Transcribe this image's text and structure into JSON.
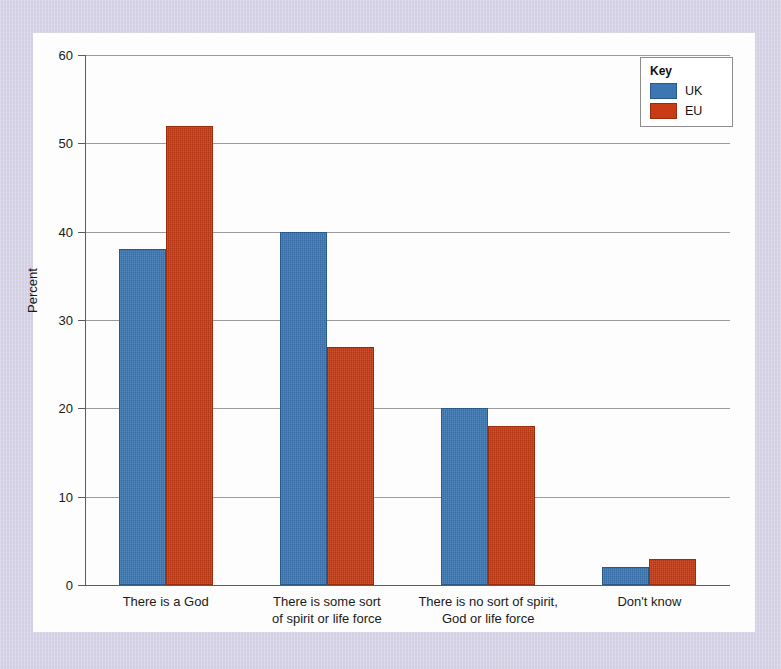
{
  "chart_data": {
    "type": "bar",
    "title": "",
    "xlabel": "",
    "ylabel": "Percent",
    "ylim": [
      0,
      60
    ],
    "yticks": [
      0,
      10,
      20,
      30,
      40,
      50,
      60
    ],
    "grid": true,
    "legend_position": "top-right",
    "categories": [
      "There is a God",
      "There is some sort\nof spirit or life force",
      "There is no sort of spirit,\nGod or life force",
      "Don't know"
    ],
    "category_lines": [
      [
        "There is a God"
      ],
      [
        "There is some sort",
        "of spirit or life force"
      ],
      [
        "There is no sort of spirit,",
        "God or life force"
      ],
      [
        "Don't know"
      ]
    ],
    "series": [
      {
        "name": "UK",
        "color": "#3b77b3",
        "values": [
          38,
          40,
          20,
          2
        ]
      },
      {
        "name": "EU",
        "color": "#c83b14",
        "values": [
          52,
          27,
          18,
          3
        ]
      }
    ]
  },
  "legend": {
    "title": "Key",
    "entries": [
      {
        "label": "UK",
        "color": "#3b77b3"
      },
      {
        "label": "EU",
        "color": "#c83b14"
      }
    ]
  },
  "colors": {
    "background": "#d3cfe4",
    "card": "#fdfdfd",
    "axis": "#5d5d5d",
    "grid": "#9a9a9a",
    "uk": "#3b77b3",
    "eu": "#c83b14"
  }
}
